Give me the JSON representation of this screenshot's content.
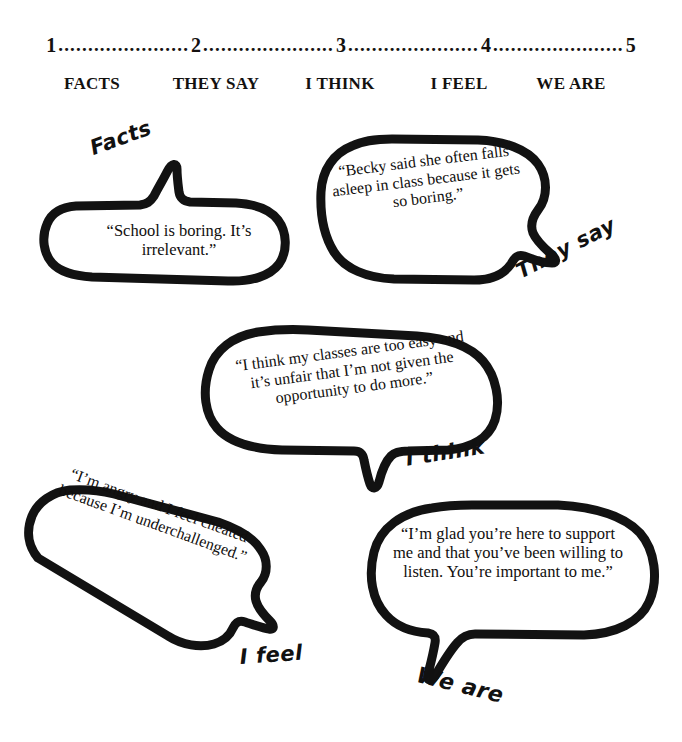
{
  "scale": {
    "numbers": [
      "1",
      "2",
      "3",
      "4",
      "5"
    ],
    "dots": "......................",
    "line": "1 ......................2 ......................3 ......................4 ......................5"
  },
  "headers": [
    {
      "label": "FACTS",
      "x": 92
    },
    {
      "label": "THEY SAY",
      "x": 215
    },
    {
      "label": "I THINK",
      "x": 340
    },
    {
      "label": "I FEEL",
      "x": 458
    },
    {
      "label": "WE ARE",
      "x": 571
    }
  ],
  "bubbles": [
    {
      "tag": "Facts",
      "quote": "“School is boring. It’s irrelevant.”"
    },
    {
      "tag": "They say",
      "quote": "“Becky said she often falls asleep in class because it gets so boring.”"
    },
    {
      "tag": "I think",
      "quote": "“I think my classes are too easy and it’s unfair that I’m not given the opportunity to do more.”"
    },
    {
      "tag": "I feel",
      "quote": "“I’m angry and I feel cheated because I’m underchallenged.”"
    },
    {
      "tag": "We are",
      "quote": "“I’m glad you’re here to support me and that you’ve been willing to listen. You’re important to me.”"
    }
  ],
  "colors": {
    "ink": "#111111",
    "background": "#ffffff"
  }
}
